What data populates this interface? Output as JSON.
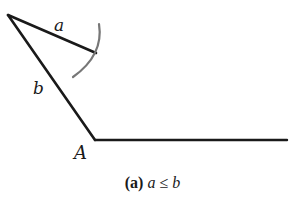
{
  "diagram": {
    "colors": {
      "line": "#1a1a1a",
      "arc": "#777777",
      "background": "#ffffff"
    },
    "points": {
      "apex": {
        "x": 8,
        "y": 15
      },
      "a_end": {
        "x": 96,
        "y": 53
      },
      "A": {
        "x": 95,
        "y": 140
      },
      "ray_end": {
        "x": 287,
        "y": 140
      }
    },
    "arc": {
      "center_x": 8,
      "center_y": 15,
      "radius": 96,
      "from": {
        "x": 100,
        "y": 24
      },
      "to": {
        "x": 72,
        "y": 77
      }
    },
    "labels": {
      "a": "a",
      "b": "b",
      "A": "A"
    },
    "caption": {
      "prefix": "(a)",
      "lhs": "a",
      "op": "≤",
      "rhs": "b"
    }
  }
}
